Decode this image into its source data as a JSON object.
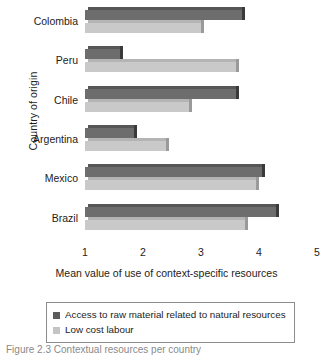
{
  "chart_data": {
    "type": "bar",
    "orientation": "horizontal",
    "title": "",
    "xlabel": "Mean value of use of context-specific resources",
    "ylabel": "Country of origin",
    "categories": [
      "Colombia",
      "Peru",
      "Chile",
      "Argentina",
      "Mexico",
      "Brazil"
    ],
    "series": [
      {
        "name": "Access to raw material related to natural resources",
        "color": "#6d6d6d",
        "values": [
          3.7,
          1.6,
          3.6,
          1.85,
          4.05,
          4.3
        ]
      },
      {
        "name": "Low cost labour",
        "color": "#c9c9c9",
        "values": [
          3.0,
          3.6,
          2.8,
          2.4,
          3.95,
          3.75
        ]
      }
    ],
    "xlim": [
      1,
      5
    ],
    "xticks": [
      1,
      2,
      3,
      4,
      5
    ],
    "xtick_labels": [
      "1",
      "2",
      "3",
      "4",
      "5"
    ],
    "grid": false,
    "legend_position": "bottom"
  },
  "axes": {
    "y_title": "Country of origin",
    "x_title": "Mean value of use of context-specific resources"
  },
  "legend": {
    "entries": [
      {
        "label": "Access to raw material related to natural resources",
        "swatch": "dark"
      },
      {
        "label": "Low cost labour",
        "swatch": "light"
      }
    ]
  },
  "caption": {
    "text": "Figure 2.3 Contextual resources per country"
  }
}
